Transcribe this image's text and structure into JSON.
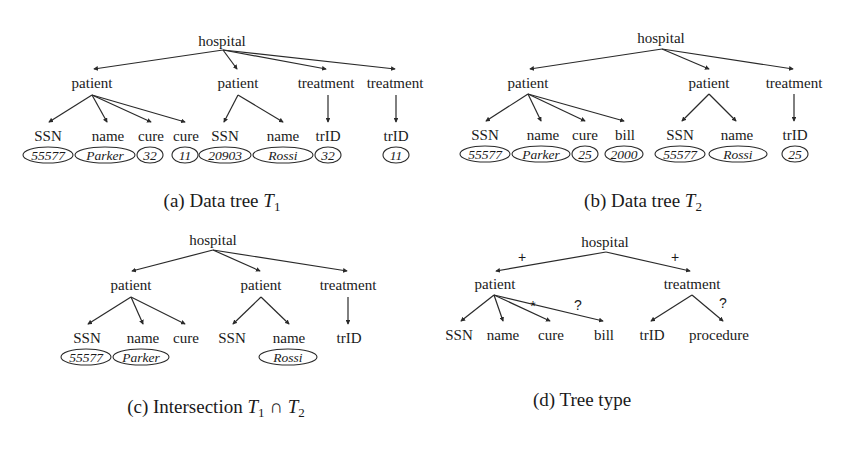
{
  "figure": {
    "panels": [
      {
        "id": "a",
        "caption_prefix": "(a) Data tree ",
        "caption_var": "T",
        "caption_sub": "1",
        "root": "hospital",
        "level1": [
          "patient",
          "patient",
          "treatment",
          "treatment"
        ],
        "leaves": [
          "SSN",
          "name",
          "cure",
          "cure",
          "SSN",
          "name",
          "trID",
          "trID"
        ],
        "values": [
          "55577",
          "Parker",
          "32",
          "11",
          "20903",
          "Rossi",
          "32",
          "11"
        ]
      },
      {
        "id": "b",
        "caption_prefix": "(b) Data tree ",
        "caption_var": "T",
        "caption_sub": "2",
        "root": "hospital",
        "level1": [
          "patient",
          "patient",
          "treatment"
        ],
        "leaves": [
          "SSN",
          "name",
          "cure",
          "bill",
          "SSN",
          "name",
          "trID"
        ],
        "values": [
          "55577",
          "Parker",
          "25",
          "2000",
          "55577",
          "Rossi",
          "25"
        ]
      },
      {
        "id": "c",
        "caption_prefix": "(c) Intersection ",
        "caption_var1": "T",
        "caption_sub1": "1",
        "caption_op": " ∩ ",
        "caption_var2": "T",
        "caption_sub2": "2",
        "root": "hospital",
        "level1": [
          "patient",
          "patient",
          "treatment"
        ],
        "leaves": [
          "SSN",
          "name",
          "cure",
          "SSN",
          "name",
          "trID"
        ],
        "values": [
          "55577",
          "Parker",
          "Rossi"
        ]
      },
      {
        "id": "d",
        "caption": "(d) Tree type",
        "root": "hospital",
        "level1": [
          "patient",
          "treatment"
        ],
        "leaves": [
          "SSN",
          "name",
          "cure",
          "bill",
          "trID",
          "procedure"
        ],
        "edge_marks": {
          "hospital_patient": "+",
          "hospital_treatment": "+",
          "patient_cure": "*",
          "patient_bill": "?",
          "treatment_procedure": "?"
        }
      }
    ]
  }
}
